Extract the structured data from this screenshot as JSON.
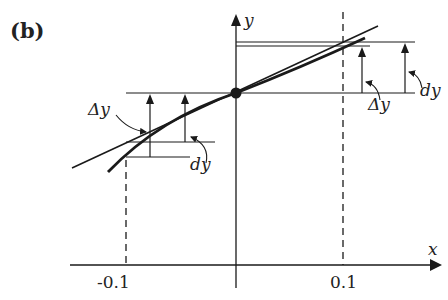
{
  "figure": {
    "panel_label": "(b)",
    "axes": {
      "x_label": "x",
      "y_label": "y",
      "x_ticks": [
        "-0.1",
        "0.1"
      ]
    },
    "annotations": {
      "left_delta_y": "Δy",
      "left_dy": "dy",
      "right_delta_y": "Δy",
      "right_dy": "dy"
    },
    "elements": {
      "tangent_line": "tangent line through point",
      "curve": "function curve",
      "point": "point of tangency"
    },
    "colors": {
      "ink": "#1a1a1a",
      "background": "#ffffff"
    }
  }
}
